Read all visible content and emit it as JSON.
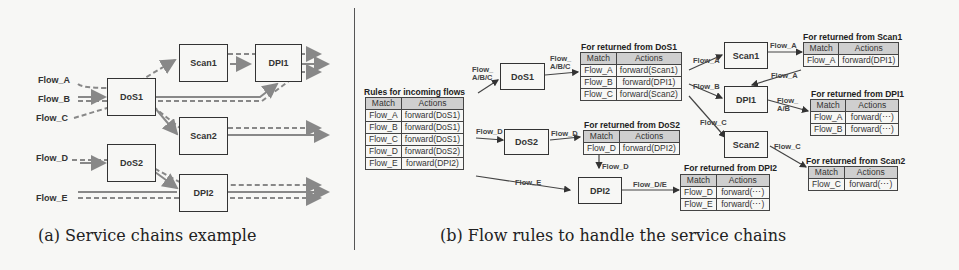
{
  "part_a": {
    "caption": "(a) Service chains example",
    "flows": [
      "Flow_A",
      "Flow_B",
      "Flow_C",
      "Flow_D",
      "Flow_E"
    ],
    "nodes": [
      "DoS1",
      "DoS2",
      "Scan1",
      "Scan2",
      "DPI1",
      "DPI2"
    ]
  },
  "part_b": {
    "caption": "(b) Flow rules to handle the service chains",
    "nodes": {
      "dos1": "DoS1",
      "dos2": "DoS2",
      "scan1": "Scan1",
      "scan2": "Scan2",
      "dpi1": "DPI1",
      "dpi2": "DPI2"
    },
    "edge_labels": {
      "in_to_dos1": "Flow_\nA/B/C",
      "dos1_out": "Flow_\nA/B/C",
      "in_to_dos2": "Flow_D",
      "dos2_out": "Flow_D",
      "in_to_dpi2": "Flow_E",
      "dos2tbl_to_dpi2": "Flow_D",
      "dpi2_out": "Flow_D/E",
      "to_scan1": "Flow_A",
      "to_dpi1": "Flow_B",
      "to_scan2": "Flow_C",
      "scan1_out": "Flow_A",
      "scan1tbl_to_dpi1": "Flow_A",
      "dpi1_out": "Flow_\nA/B",
      "scan2_out": "Flow_C"
    },
    "tables": {
      "incoming": {
        "title": "Rules for incoming flows",
        "headers": [
          "Match",
          "Actions"
        ],
        "rows": [
          [
            "Flow_A",
            "forward(DoS1)"
          ],
          [
            "Flow_B",
            "forward(DoS1)"
          ],
          [
            "Flow_C",
            "forward(DoS1)"
          ],
          [
            "Flow_D",
            "forward(DoS2)"
          ],
          [
            "Flow_E",
            "forward(DPI2)"
          ]
        ]
      },
      "from_dos1": {
        "title": "For returned from DoS1",
        "headers": [
          "Match",
          "Actions"
        ],
        "rows": [
          [
            "Flow_A",
            "forward(Scan1)"
          ],
          [
            "Flow_B",
            "forward(DPI1)"
          ],
          [
            "Flow_C",
            "forward(Scan2)"
          ]
        ]
      },
      "from_dos2": {
        "title": "For returned from DoS2",
        "headers": [
          "Match",
          "Actions"
        ],
        "rows": [
          [
            "Flow_D",
            "forward(DPI2)"
          ]
        ]
      },
      "from_scan1": {
        "title": "For returned from Scan1",
        "headers": [
          "Match",
          "Actions"
        ],
        "rows": [
          [
            "Flow_A",
            "forward(DPI1)"
          ]
        ]
      },
      "from_dpi1": {
        "title": "For returned from DPI1",
        "headers": [
          "Match",
          "Actions"
        ],
        "rows": [
          [
            "Flow_A",
            "forward(⋯)"
          ],
          [
            "Flow_B",
            "forward(⋯)"
          ]
        ]
      },
      "from_scan2": {
        "title": "For returned from Scan2",
        "headers": [
          "Match",
          "Actions"
        ],
        "rows": [
          [
            "Flow_C",
            "forward(⋯)"
          ]
        ]
      },
      "from_dpi2": {
        "title": "For returned from DPI2",
        "headers": [
          "Match",
          "Actions"
        ],
        "rows": [
          [
            "Flow_D",
            "forward(⋯)"
          ],
          [
            "Flow_E",
            "forward(⋯)"
          ]
        ]
      }
    }
  }
}
